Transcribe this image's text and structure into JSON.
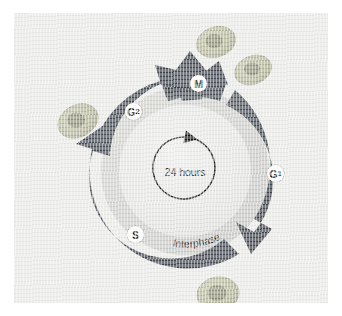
{
  "figure": {
    "background_color": "#e9e9e7",
    "arrow_color": "#4a5058",
    "ring_color": "#cfcfcd",
    "disc_color": "#e4e4e2",
    "cell_color": "#b6b79a",
    "nucleus_color": "#8b8c78",
    "label_chip_color": "#fdfdfb"
  },
  "center": {
    "duration_label": "24 hours",
    "arrow_direction": "clockwise"
  },
  "band_labels": {
    "top": "Division",
    "bottom": "Interphase"
  },
  "phases": [
    {
      "id": "m",
      "label": "M",
      "sub": "",
      "name": "M phase",
      "group": "Division"
    },
    {
      "id": "g1",
      "label": "G",
      "sub": "1",
      "name": "G1 phase",
      "group": "Interphase"
    },
    {
      "id": "s",
      "label": "S",
      "sub": "",
      "name": "S phase",
      "group": "Interphase"
    },
    {
      "id": "g2",
      "label": "G",
      "sub": "2",
      "name": "G2 phase",
      "group": "Interphase"
    }
  ],
  "cells": [
    {
      "id": "daughter-cell-left",
      "position": "top-left of M arrow"
    },
    {
      "id": "daughter-cell-right",
      "position": "top-right of M arrow"
    },
    {
      "id": "cell-left",
      "position": "left of ring"
    },
    {
      "id": "cell-bottom",
      "position": "below ring"
    }
  ]
}
